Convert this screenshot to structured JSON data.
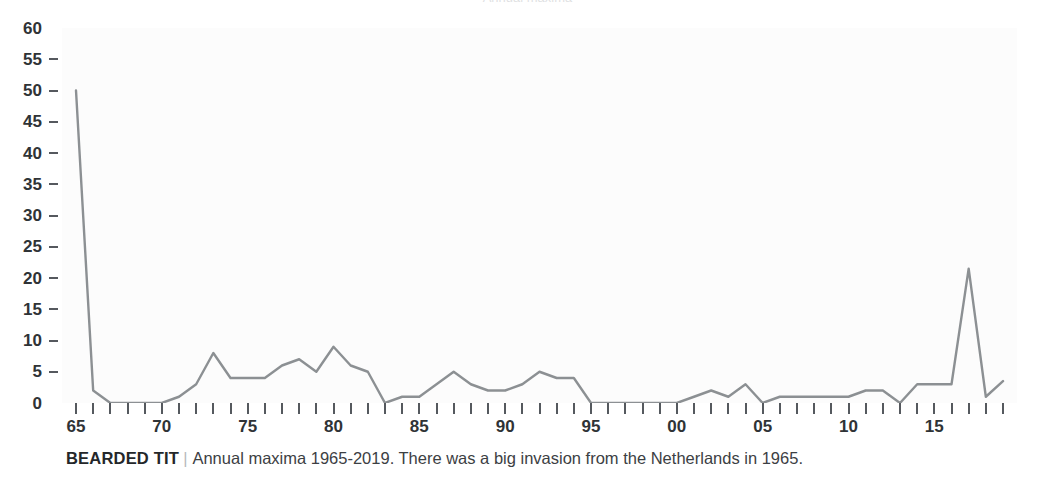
{
  "header": {
    "clipped_text": "Annual maxima"
  },
  "caption": {
    "species": "BEARDED TIT",
    "separator": "|",
    "text": "Annual maxima 1965-2019. There was a big invasion from the Netherlands in 1965."
  },
  "chart_data": {
    "type": "line",
    "title": "",
    "subtitle": "",
    "xlabel": "",
    "ylabel": "",
    "ylim": [
      0,
      60
    ],
    "xlim": [
      1965,
      2019
    ],
    "ytick_values": [
      0,
      5,
      10,
      15,
      20,
      25,
      30,
      35,
      40,
      45,
      50,
      55,
      60
    ],
    "ytick_labels": [
      "0",
      "5",
      "10",
      "15",
      "20",
      "25",
      "30",
      "35",
      "40",
      "45",
      "50",
      "55",
      "60"
    ],
    "ytick_dash_visible": [
      false,
      true,
      true,
      true,
      true,
      true,
      true,
      true,
      true,
      true,
      true,
      true,
      false
    ],
    "xtick_values": [
      1965,
      1966,
      1967,
      1968,
      1969,
      1970,
      1971,
      1972,
      1973,
      1974,
      1975,
      1976,
      1977,
      1978,
      1979,
      1980,
      1981,
      1982,
      1983,
      1984,
      1985,
      1986,
      1987,
      1988,
      1989,
      1990,
      1991,
      1992,
      1993,
      1994,
      1995,
      1996,
      1997,
      1998,
      1999,
      2000,
      2001,
      2002,
      2003,
      2004,
      2005,
      2006,
      2007,
      2008,
      2009,
      2010,
      2011,
      2012,
      2013,
      2014,
      2015,
      2016,
      2017,
      2018,
      2019
    ],
    "xtick_labeled": [
      1965,
      1970,
      1975,
      1980,
      1985,
      1990,
      1995,
      2000,
      2005,
      2010,
      2015
    ],
    "xtick_labels": [
      "65",
      "70",
      "75",
      "80",
      "85",
      "90",
      "95",
      "00",
      "05",
      "10",
      "15"
    ],
    "grid": false,
    "legend": null,
    "line_color": "#8c9093",
    "line_width": 2.4,
    "series": [
      {
        "name": "Bearded Tit annual maxima",
        "x": [
          1965,
          1966,
          1967,
          1968,
          1969,
          1970,
          1971,
          1972,
          1973,
          1974,
          1975,
          1976,
          1977,
          1978,
          1979,
          1980,
          1981,
          1982,
          1983,
          1984,
          1985,
          1986,
          1987,
          1988,
          1989,
          1990,
          1991,
          1992,
          1993,
          1994,
          1995,
          1996,
          1997,
          1998,
          1999,
          2000,
          2001,
          2002,
          2003,
          2004,
          2005,
          2006,
          2007,
          2008,
          2009,
          2010,
          2011,
          2012,
          2013,
          2014,
          2015,
          2016,
          2017,
          2018,
          2019
        ],
        "values": [
          50,
          2,
          0,
          0,
          0,
          0,
          1,
          3,
          8,
          4,
          4,
          4,
          6,
          7,
          5,
          9,
          6,
          5,
          0,
          1,
          1,
          3,
          5,
          3,
          2,
          2,
          3,
          5,
          4,
          4,
          0,
          0,
          0,
          0,
          0,
          0,
          1,
          2,
          1,
          3,
          0,
          1,
          1,
          1,
          1,
          1,
          2,
          2,
          0,
          3,
          3,
          3,
          21.5,
          1,
          3.5
        ]
      }
    ]
  }
}
